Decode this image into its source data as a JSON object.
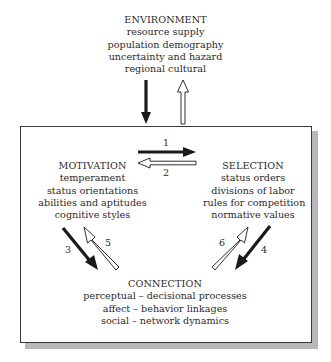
{
  "environment": {
    "title": "ENVIRONMENT",
    "items": [
      "resource supply",
      "population demography",
      "uncertainty and hazard",
      "regional cultural"
    ]
  },
  "motivation": {
    "title": "MOTIVATION",
    "items": [
      "temperament",
      "status orientations",
      "abilities and aptitudes",
      "cognitive styles"
    ]
  },
  "selection": {
    "title": "SELECTION",
    "items": [
      "status orders",
      "divisions of labor",
      "rules for competition",
      "normative values"
    ]
  },
  "connection": {
    "title": "CONNECTION",
    "items": [
      "perceptual – decisional processes",
      "affect – behavior linkages",
      "social – network dynamics"
    ]
  },
  "arrows": {
    "env_down": {
      "style": "solid-black",
      "from": "ENVIRONMENT",
      "to": "system box"
    },
    "env_up": {
      "style": "hollow-white",
      "from": "system box",
      "to": "ENVIRONMENT"
    },
    "a1": {
      "label": "1",
      "style": "solid-black",
      "from": "MOTIVATION",
      "to": "SELECTION"
    },
    "a2": {
      "label": "2",
      "style": "hollow-white",
      "from": "SELECTION",
      "to": "MOTIVATION"
    },
    "a3": {
      "label": "3",
      "style": "solid-black",
      "from": "MOTIVATION",
      "to": "CONNECTION"
    },
    "a4": {
      "label": "4",
      "style": "solid-black",
      "from": "SELECTION",
      "to": "CONNECTION"
    },
    "a5": {
      "label": "5",
      "style": "hollow-white",
      "from": "CONNECTION",
      "to": "MOTIVATION"
    },
    "a6": {
      "label": "6",
      "style": "hollow-white",
      "from": "CONNECTION",
      "to": "SELECTION"
    }
  },
  "colors": {
    "line": "#1a1a1a",
    "box_border": "#3a3a3a",
    "shadow": "#b8b8b8"
  }
}
